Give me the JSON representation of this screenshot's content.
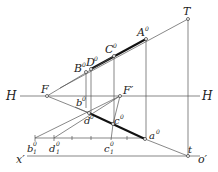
{
  "diagram": {
    "type": "descriptive-geometry perspective construction",
    "labels": {
      "T": "T",
      "A0": "A",
      "C0": "C",
      "D0": "D",
      "B0": "B",
      "F": "F",
      "Fp": "F′",
      "H_left": "H",
      "H_right": "H",
      "b0": "b",
      "d0": "d",
      "c0": "c",
      "a0": "a",
      "x": "x′",
      "o": "o′",
      "t": "t",
      "b1": "b",
      "d1": "d",
      "c1": "c",
      "sup0": "0",
      "sub1": "1"
    },
    "points": {
      "T": [
        188,
        19
      ],
      "A0": [
        146,
        39
      ],
      "C0": [
        114,
        56
      ],
      "D0": [
        91,
        69
      ],
      "B0": [
        86,
        72
      ],
      "F": [
        47,
        96
      ],
      "Fp": [
        120,
        96
      ],
      "b0": [
        88,
        106
      ],
      "d0": [
        89,
        113
      ],
      "c0": [
        113,
        124
      ],
      "a0": [
        145,
        139
      ],
      "t": [
        188,
        156
      ],
      "b1": [
        35,
        138
      ],
      "d1": [
        54,
        138
      ],
      "c1": [
        112,
        138
      ]
    },
    "lines": {
      "horizon_y": 96,
      "ground_y": 156,
      "scale_y": 138
    },
    "colors": {
      "line": "#555555",
      "thick": "#111111",
      "text": "#222222"
    }
  }
}
